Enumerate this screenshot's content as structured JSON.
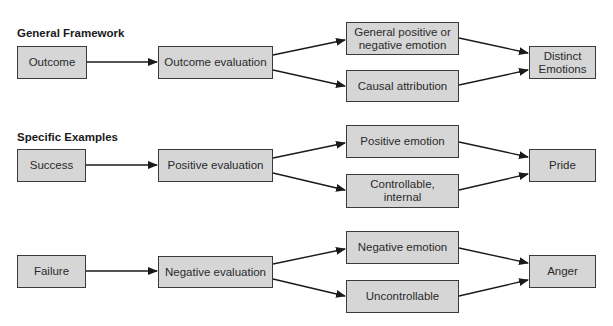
{
  "sections": [
    {
      "heading": "General Framework",
      "nodes": {
        "start": "Outcome",
        "eval": "Outcome evaluation",
        "upper": "General positive or negative emotion",
        "lower": "Causal attribution",
        "result": "Distinct Emotions"
      }
    },
    {
      "heading": "Specific Examples",
      "nodes": {
        "start": "Success",
        "eval": "Positive evaluation",
        "upper": "Positive emotion",
        "lower": "Controllable, internal",
        "result": "Pride"
      }
    },
    {
      "heading": "",
      "nodes": {
        "start": "Failure",
        "eval": "Negative evaluation",
        "upper": "Negative emotion",
        "lower": "Uncontrollable",
        "result": "Anger"
      }
    }
  ],
  "colors": {
    "box_fill": "#d6d6d6",
    "border": "#3a3a3a",
    "arrow": "#1a1a1a"
  }
}
